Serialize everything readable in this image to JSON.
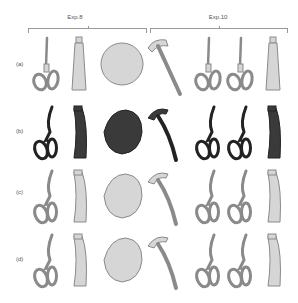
{
  "groups": [
    {
      "label": "Exp.8"
    },
    {
      "label": "Exp.10"
    }
  ],
  "rows": [
    {
      "label": "(a)",
      "shade": "light"
    },
    {
      "label": "(b)",
      "shade": "dark"
    },
    {
      "label": "(c)",
      "shade": "light"
    },
    {
      "label": "(d)",
      "shade": "light"
    }
  ],
  "columns": [
    {
      "group": "Exp.8",
      "object": "scissors"
    },
    {
      "group": "Exp.8",
      "object": "tube"
    },
    {
      "group": "Exp.8",
      "object": "ball"
    },
    {
      "group": "Exp.10",
      "object": "hammer"
    },
    {
      "group": "Exp.10",
      "object": "scissors"
    },
    {
      "group": "Exp.10",
      "object": "scissors"
    },
    {
      "group": "Exp.10",
      "object": "tube"
    }
  ],
  "colors": {
    "light_fill": "#d6d6d6",
    "light_stroke": "#8a8a8a",
    "dark_fill": "#3a3a3a",
    "dark_stroke": "#222222",
    "bracket": "#999999"
  }
}
